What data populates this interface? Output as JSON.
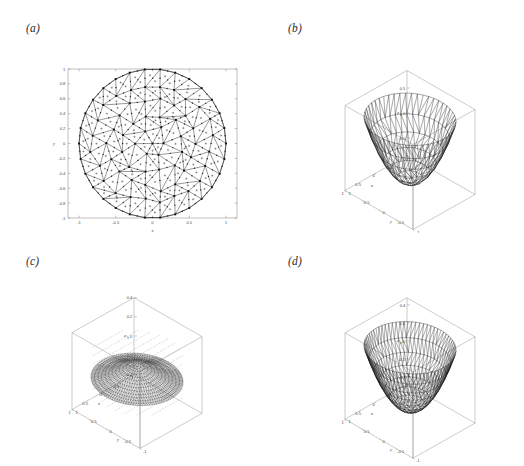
{
  "figure": {
    "background": "#ffffff",
    "panels": [
      {
        "id": "a",
        "label": "(a)",
        "kind": "mesh2d",
        "description": "Triangular finite-element mesh over the unit disk",
        "axes": {
          "xlabel": "x",
          "ylabel": "y",
          "xlim": [
            -1.15,
            1.15
          ],
          "ylim": [
            -1,
            1
          ],
          "xticks": [
            "-1",
            "-0.5",
            "0",
            "0.5",
            "1"
          ],
          "xtickvals": [
            -1,
            -0.5,
            0,
            0.5,
            1
          ],
          "yticks": [
            "1",
            "0.8",
            "0.6",
            "0.4",
            "0.2",
            "0",
            "-0.2",
            "-0.4",
            "-0.6",
            "-0.8",
            "-1"
          ],
          "ytickvals": [
            1,
            0.8,
            0.6,
            0.4,
            0.2,
            0,
            -0.2,
            -0.4,
            -0.6,
            -0.8,
            -1
          ],
          "box": true,
          "grid": false
        },
        "markers": {
          "vertex": "filled-square",
          "midside": "small-dot",
          "interior": "plus"
        },
        "colors": {
          "mesh": "#1a1a1a",
          "axis": "#808080",
          "marker": "#111111"
        }
      },
      {
        "id": "b",
        "label": "(b)",
        "kind": "surface3d",
        "description": "Triangulated surface over unit disk, coarse mesh",
        "axes": {
          "xlabel": "x",
          "ylabel": "y",
          "zlabel": "e",
          "zlabel_sub": "h",
          "xticks": [
            "-1",
            "-0.5",
            "0",
            "0.5",
            "1"
          ],
          "yticks": [
            "1",
            "0.5",
            "0",
            "-0.5",
            "-1"
          ],
          "zticks": [
            "0.5",
            "0",
            "-0.5"
          ],
          "ztickvals": [
            0.5,
            0,
            -0.5
          ],
          "zlim": [
            -0.85,
            0.85
          ],
          "box": true,
          "grid": false
        },
        "colors": {
          "mesh": "#1a1a1a",
          "box": "#8c8c8c"
        }
      },
      {
        "id": "c",
        "label": "(c)",
        "kind": "surface3d",
        "description": "Dense flat triangulated surface with dashed projection contours",
        "axes": {
          "xlabel": "x",
          "ylabel": "y",
          "zlabel": "e",
          "zlabel_sub": "h",
          "xticks": [
            "-1",
            "-0.5",
            "0",
            "0.5",
            "1"
          ],
          "yticks": [
            "1",
            "0.5",
            "0",
            "-0.5",
            "-1"
          ],
          "zticks": [
            "0.4",
            "0.2",
            "0",
            "-0.2",
            "-0.4"
          ],
          "ztickvals": [
            0.4,
            0.2,
            0,
            -0.2,
            -0.4
          ],
          "zlim": [
            -0.4,
            0.4
          ],
          "box": true,
          "grid": false
        },
        "colors": {
          "mesh": "#242424",
          "box": "#8c8c8c",
          "dashed": "#9a9a9a"
        }
      },
      {
        "id": "d",
        "label": "(d)",
        "kind": "surface3d",
        "description": "Triangulated surface over unit disk, medium mesh",
        "axes": {
          "xlabel": "x",
          "ylabel": "y",
          "zlabel": "e",
          "zlabel_sub": "h",
          "xticks": [
            "-1",
            "-0.5",
            "0",
            "0.5",
            "1"
          ],
          "yticks": [
            "1",
            "0.5",
            "0",
            "-0.5",
            "-1"
          ],
          "zticks": [
            "0.4",
            "0.2",
            "0",
            "-0.2",
            "-0.4"
          ],
          "ztickvals": [
            0.4,
            0.2,
            0,
            -0.2,
            -0.4
          ],
          "zlim": [
            -0.48,
            0.48
          ],
          "box": true,
          "grid": false
        },
        "colors": {
          "mesh": "#1a1a1a",
          "box": "#8c8c8c"
        }
      }
    ]
  },
  "chart_data": [
    {
      "type": "scatter",
      "title": "(a)",
      "xlabel": "x",
      "ylabel": "y",
      "xlim": [
        -1.15,
        1.15
      ],
      "ylim": [
        -1,
        1
      ],
      "xticks": [
        -1,
        -0.5,
        0,
        0.5,
        1
      ],
      "yticks": [
        1,
        0.8,
        0.6,
        0.4,
        0.2,
        0,
        -0.2,
        -0.4,
        -0.6,
        -0.8,
        -1
      ],
      "grid": false,
      "legend": null,
      "note": "Unstructured triangular mesh of the unit disk; vertices marked with squares, edge midpoints with dots, element centroids with plus signs."
    },
    {
      "type": "line",
      "title": "(b)",
      "xlabel": "x",
      "ylabel": "y",
      "zlabel": "e_h",
      "xlim": [
        -1,
        1
      ],
      "ylim": [
        -1,
        1
      ],
      "zlim": [
        -0.85,
        0.85
      ],
      "xticks": [
        -1,
        -0.5,
        0,
        0.5,
        1
      ],
      "yticks": [
        1,
        0.5,
        0,
        -0.5,
        -1
      ],
      "zticks": [
        0.5,
        0,
        -0.5
      ],
      "grid": false,
      "note": "3-D wireframe of a radially symmetric bowl-shaped field on the unit disk."
    },
    {
      "type": "line",
      "title": "(c)",
      "xlabel": "x",
      "ylabel": "y",
      "zlabel": "e_h",
      "xlim": [
        -1,
        1
      ],
      "ylim": [
        -1,
        1
      ],
      "zlim": [
        -0.4,
        0.4
      ],
      "xticks": [
        -1,
        -0.5,
        0,
        0.5,
        1
      ],
      "yticks": [
        1,
        0.5,
        0,
        -0.5,
        -1
      ],
      "zticks": [
        0.4,
        0.2,
        0,
        -0.2,
        -0.4
      ],
      "grid": false,
      "note": "Near-flat dense mesh surface with dashed projected grid lines above and below."
    },
    {
      "type": "line",
      "title": "(d)",
      "xlabel": "x",
      "ylabel": "y",
      "zlabel": "e_h",
      "xlim": [
        -1,
        1
      ],
      "ylim": [
        -1,
        1
      ],
      "zlim": [
        -0.48,
        0.48
      ],
      "xticks": [
        -1,
        -0.5,
        0,
        0.5,
        1
      ],
      "yticks": [
        1,
        0.5,
        0,
        -0.5,
        -1
      ],
      "zticks": [
        0.4,
        0.2,
        0,
        -0.2,
        -0.4
      ],
      "grid": false,
      "note": "3-D wireframe with medium-density triangulation over the unit disk."
    }
  ]
}
